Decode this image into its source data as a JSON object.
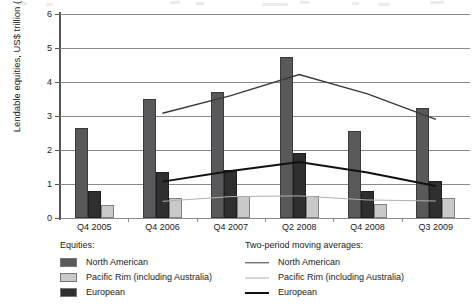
{
  "chart_data": {
    "type": "bar",
    "title": "",
    "xlabel": "",
    "ylabel": "Lendable equities, US$ trillion (10¹²)",
    "ylabel_main": "Lendable equities, US$ trillion (10",
    "ylabel_sup": "12",
    "ylabel_tail": ")",
    "ylim": [
      0,
      6
    ],
    "ytick_labels": [
      "0",
      "1",
      "2",
      "3",
      "4",
      "5",
      "6"
    ],
    "ytick_values": [
      0,
      1,
      2,
      3,
      4,
      5,
      6
    ],
    "grid": true,
    "legend_position": "bottom",
    "categories": [
      "Q4 2005",
      "Q4 2006",
      "Q4 2007",
      "Q2 2008",
      "Q4 2008",
      "Q3 2009"
    ],
    "series": [
      {
        "name": "North American",
        "key": "na",
        "color": "#59595b",
        "values": [
          2.65,
          3.5,
          3.7,
          4.75,
          2.55,
          3.25
        ]
      },
      {
        "name": "European",
        "key": "eu",
        "color": "#2f2f30",
        "values": [
          0.78,
          1.35,
          1.4,
          1.9,
          0.78,
          1.1
        ]
      },
      {
        "name": "Pacific Rim (including Australia)",
        "key": "pr",
        "color": "#c9c9c9",
        "values": [
          0.38,
          0.6,
          0.65,
          0.65,
          0.4,
          0.6
        ]
      }
    ],
    "moving_averages": [
      {
        "name": "North American",
        "key": "na",
        "color": "#3a3a3a",
        "values": [
          null,
          3.08,
          3.6,
          4.22,
          3.65,
          2.9
        ]
      },
      {
        "name": "European",
        "key": "eu",
        "color": "#111111",
        "values": [
          null,
          1.07,
          1.38,
          1.65,
          1.34,
          0.94
        ]
      },
      {
        "name": "Pacific Rim (including Australia)",
        "key": "pr",
        "color": "#b0b0b0",
        "values": [
          null,
          0.49,
          0.63,
          0.65,
          0.53,
          0.5
        ]
      }
    ]
  },
  "legend": {
    "bars_title": "Equities:",
    "lines_title": "Two-period moving averages:",
    "bar_items": [
      {
        "label": "North American",
        "key": "na"
      },
      {
        "label": "Pacific Rim (including Australia)",
        "key": "pr"
      },
      {
        "label": "European",
        "key": "eu"
      }
    ],
    "line_items": [
      {
        "label": "North American",
        "key": "na"
      },
      {
        "label": "Pacific Rim (including Australia)",
        "key": "pr"
      },
      {
        "label": "European",
        "key": "eu"
      }
    ]
  }
}
